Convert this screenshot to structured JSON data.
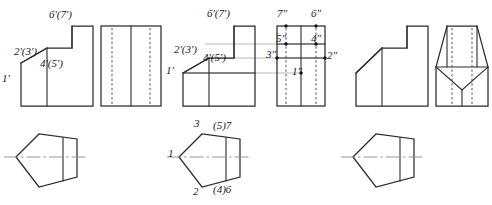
{
  "figure": {
    "colors": {
      "object_line": "#2b2b2b",
      "hidden_line": "#555555",
      "projection_line": "#b8b8b8",
      "center_line": "#8a8a8a",
      "background": "#ffffff",
      "text": "#1a1a1a"
    },
    "groups": [
      {
        "name": "left-group",
        "views": [
          "front-view",
          "right-side-view",
          "top-view"
        ],
        "labels": [
          "1'",
          "2'(3')",
          "4'(5')",
          "6'(7')"
        ]
      },
      {
        "name": "middle-group",
        "views": [
          "front-view",
          "right-side-view",
          "top-view"
        ],
        "labels": [
          "1'",
          "2'(3')",
          "4'(5')",
          "6'(7')",
          "1\"",
          "2\"",
          "3\"",
          "4\"",
          "5\"",
          "6\"",
          "7\"",
          "1",
          "2",
          "3",
          "(4)6",
          "(5)7"
        ]
      },
      {
        "name": "right-group",
        "views": [
          "front-view",
          "right-side-view",
          "top-view"
        ],
        "labels": []
      }
    ]
  },
  "labels": {
    "front_left": {
      "p1": "1'",
      "p23": "2'(3')",
      "p45": "4'(5')",
      "p67": "6'(7')"
    },
    "front_middle": {
      "p1": "1'",
      "p23": "2'(3')",
      "p45": "4'(5')",
      "p67": "6'(7')"
    },
    "side_middle": {
      "p1": "1″",
      "p2": "2″",
      "p3": "3″",
      "p4": "4″",
      "p5": "5″",
      "p6": "6″",
      "p7": "7″"
    },
    "top_middle": {
      "p1": "1",
      "p2": "2",
      "p3": "3",
      "p46": "(4)6",
      "p57": "(5)7"
    }
  }
}
